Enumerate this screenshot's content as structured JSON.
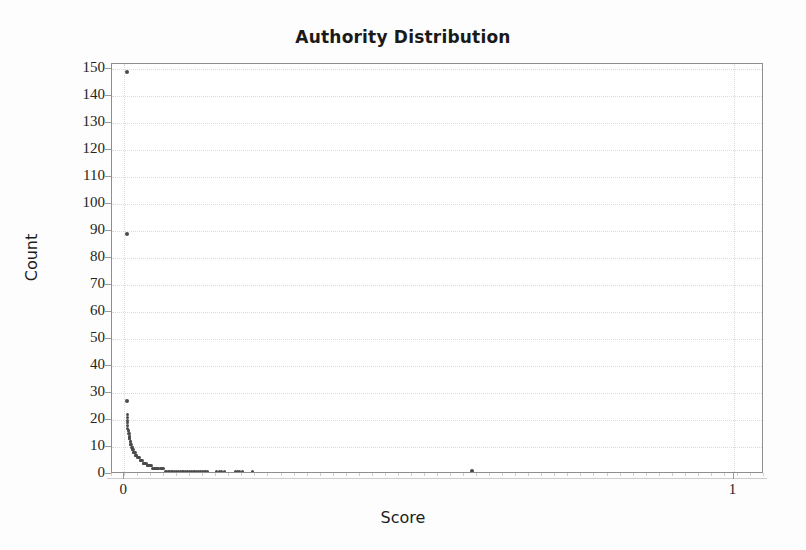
{
  "chart_data": {
    "type": "scatter",
    "title": "Authority Distribution",
    "xlabel": "Score",
    "ylabel": "Count",
    "xlim": [
      -0.02,
      1.05
    ],
    "ylim": [
      0,
      152
    ],
    "grid": true,
    "legend": null,
    "y_ticks": [
      0,
      10,
      20,
      30,
      40,
      50,
      60,
      70,
      80,
      90,
      100,
      110,
      120,
      130,
      140,
      150
    ],
    "y_tick_labels": [
      "0",
      "10",
      "20",
      "30",
      "40",
      "50",
      "60",
      "70",
      "80",
      "90",
      "100",
      "110",
      "120",
      "130",
      "140",
      "150"
    ],
    "x_ticks": [
      0,
      1
    ],
    "x_tick_labels": [
      "0",
      "1"
    ],
    "x_minor_tick_count": 50,
    "series": [
      {
        "name": "authority",
        "marker": "dot",
        "color": "#4b4b4b",
        "points": [
          [
            0.004,
            149
          ],
          [
            0.004,
            89
          ],
          [
            0.004,
            27
          ],
          [
            0.005,
            22
          ],
          [
            0.005,
            21
          ],
          [
            0.005,
            20
          ],
          [
            0.006,
            19
          ],
          [
            0.006,
            18
          ],
          [
            0.006,
            17
          ],
          [
            0.007,
            16
          ],
          [
            0.007,
            16
          ],
          [
            0.007,
            15
          ],
          [
            0.008,
            15
          ],
          [
            0.008,
            14
          ],
          [
            0.008,
            14
          ],
          [
            0.009,
            13
          ],
          [
            0.009,
            13
          ],
          [
            0.01,
            12
          ],
          [
            0.01,
            12
          ],
          [
            0.011,
            11
          ],
          [
            0.011,
            11
          ],
          [
            0.012,
            11
          ],
          [
            0.012,
            10
          ],
          [
            0.013,
            10
          ],
          [
            0.013,
            10
          ],
          [
            0.014,
            9
          ],
          [
            0.014,
            9
          ],
          [
            0.015,
            9
          ],
          [
            0.016,
            8
          ],
          [
            0.016,
            8
          ],
          [
            0.017,
            8
          ],
          [
            0.018,
            8
          ],
          [
            0.018,
            7
          ],
          [
            0.019,
            7
          ],
          [
            0.02,
            7
          ],
          [
            0.021,
            7
          ],
          [
            0.022,
            6
          ],
          [
            0.023,
            6
          ],
          [
            0.024,
            6
          ],
          [
            0.025,
            6
          ],
          [
            0.026,
            5
          ],
          [
            0.027,
            5
          ],
          [
            0.028,
            5
          ],
          [
            0.029,
            5
          ],
          [
            0.03,
            5
          ],
          [
            0.031,
            4
          ],
          [
            0.032,
            4
          ],
          [
            0.033,
            4
          ],
          [
            0.034,
            4
          ],
          [
            0.035,
            4
          ],
          [
            0.036,
            4
          ],
          [
            0.038,
            3
          ],
          [
            0.039,
            3
          ],
          [
            0.04,
            3
          ],
          [
            0.041,
            3
          ],
          [
            0.043,
            3
          ],
          [
            0.044,
            3
          ],
          [
            0.045,
            3
          ],
          [
            0.047,
            2
          ],
          [
            0.048,
            2
          ],
          [
            0.05,
            2
          ],
          [
            0.051,
            2
          ],
          [
            0.053,
            2
          ],
          [
            0.055,
            2
          ],
          [
            0.057,
            2
          ],
          [
            0.059,
            2
          ],
          [
            0.061,
            2
          ],
          [
            0.063,
            2
          ],
          [
            0.065,
            2
          ],
          [
            0.067,
            1
          ],
          [
            0.07,
            1
          ],
          [
            0.072,
            1
          ],
          [
            0.075,
            1
          ],
          [
            0.078,
            1
          ],
          [
            0.08,
            1
          ],
          [
            0.083,
            1
          ],
          [
            0.086,
            1
          ],
          [
            0.089,
            1
          ],
          [
            0.092,
            1
          ],
          [
            0.095,
            1
          ],
          [
            0.098,
            1
          ],
          [
            0.101,
            1
          ],
          [
            0.104,
            1
          ],
          [
            0.107,
            1
          ],
          [
            0.11,
            1
          ],
          [
            0.113,
            1
          ],
          [
            0.116,
            1
          ],
          [
            0.119,
            1
          ],
          [
            0.122,
            1
          ],
          [
            0.125,
            1
          ],
          [
            0.128,
            1
          ],
          [
            0.131,
            1
          ],
          [
            0.134,
            1
          ],
          [
            0.137,
            1
          ],
          [
            0.152,
            1
          ],
          [
            0.156,
            1
          ],
          [
            0.16,
            1
          ],
          [
            0.164,
            1
          ],
          [
            0.182,
            1
          ],
          [
            0.186,
            1
          ],
          [
            0.19,
            1
          ],
          [
            0.194,
            1
          ],
          [
            0.21,
            1
          ],
          [
            0.57,
            1
          ]
        ]
      }
    ],
    "annotations": [
      {
        "text": "peak count at lowest score bin",
        "value": 149
      },
      {
        "text": "isolated outlier at high score",
        "value": 1
      }
    ]
  },
  "style": {
    "point_color": "#4b4b4b",
    "frame_color": "#8e8e8e",
    "grid_color": "#dadada",
    "text_color": "#232323",
    "background": "#ffffff"
  }
}
